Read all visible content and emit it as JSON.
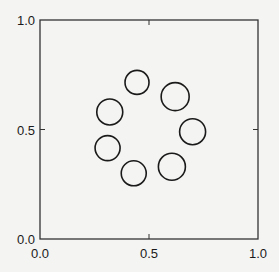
{
  "chart_data": {
    "type": "scatter",
    "title": "",
    "xlabel": "",
    "ylabel": "",
    "xlim": [
      0.0,
      1.0
    ],
    "ylim": [
      0.0,
      1.0
    ],
    "grid": false,
    "legend": null,
    "x_ticks": [
      {
        "value": 0.0,
        "label": "0.0"
      },
      {
        "value": 0.5,
        "label": "0.5"
      },
      {
        "value": 1.0,
        "label": "1.0"
      }
    ],
    "y_ticks": [
      {
        "value": 0.0,
        "label": "0.0"
      },
      {
        "value": 0.5,
        "label": "0.5"
      },
      {
        "value": 1.0,
        "label": "1.0"
      }
    ],
    "marker": "open-circle",
    "series": [
      {
        "name": "points",
        "points": [
          {
            "x": 0.445,
            "y": 0.715,
            "r": 12
          },
          {
            "x": 0.62,
            "y": 0.65,
            "r": 14
          },
          {
            "x": 0.32,
            "y": 0.58,
            "r": 13
          },
          {
            "x": 0.7,
            "y": 0.49,
            "r": 13
          },
          {
            "x": 0.31,
            "y": 0.415,
            "r": 12.5
          },
          {
            "x": 0.605,
            "y": 0.33,
            "r": 13.5
          },
          {
            "x": 0.43,
            "y": 0.3,
            "r": 12.5
          }
        ]
      }
    ],
    "colors": {
      "stroke": "#1a1a1a",
      "background": "#f4f4f2"
    }
  }
}
